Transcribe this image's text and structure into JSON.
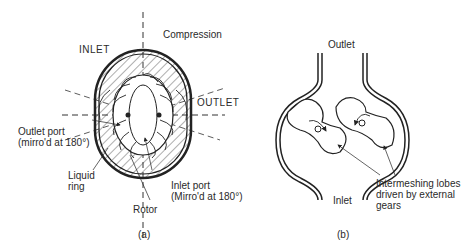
{
  "figure_a": {
    "caption": "(a)",
    "title": "Liquid ring pump",
    "labels": {
      "inlet": "INLET",
      "compression": "Compression",
      "outlet": "OUTLET",
      "outlet_port_line1": "Outlet port",
      "outlet_port_line2": "(mirro'd at 180°)",
      "liquid_line1": "Liquid",
      "liquid_line2": "ring",
      "inlet_port_line1": "Inlet port",
      "inlet_port_line2": "(Mirro'd at 180°)",
      "rotor": "Rotor"
    }
  },
  "figure_b": {
    "caption": "(b)",
    "title": "Lobe pump",
    "labels": {
      "outlet": "Outlet",
      "inlet": "Inlet",
      "lobes_line1": "Intermeshing lobes",
      "lobes_line2": "driven by external",
      "lobes_line3": "gears"
    }
  },
  "colors": {
    "line": "#222222",
    "hatch": "#333333",
    "background": "#ffffff"
  }
}
